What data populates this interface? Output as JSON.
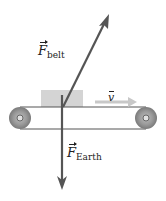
{
  "diagram": {
    "forces": [
      {
        "symbol": "F",
        "subscript": "belt",
        "direction": "up-right",
        "color": "#555555"
      },
      {
        "symbol": "F",
        "subscript": "Earth",
        "direction": "down",
        "color": "#555555"
      }
    ],
    "velocity": {
      "symbol": "v",
      "direction": "right",
      "color": "#c8c8c8"
    },
    "box_color": "#d4d4d4",
    "pulley_color": "#8a8a8a",
    "belt_color": "#555555"
  }
}
